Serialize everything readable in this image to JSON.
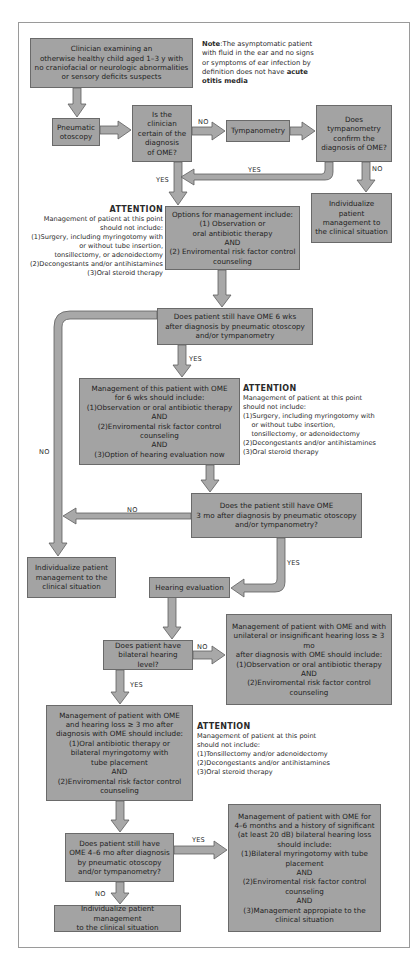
{
  "colors": {
    "box_fill": "#a3a3a3",
    "box_border": "#6a6a6a",
    "arrow_fill": "#a8a8a8",
    "arrow_stroke": "#5e5e5e",
    "frame_border": "#9a9a9a"
  },
  "note": {
    "label": "Note",
    "text": ":The asymptomatic patient with fluid in the ear and no signs or symptoms of ear infection by definition does not have ",
    "bold_end": "acute otitis media"
  },
  "nodes": {
    "start": "Clinician examining an\notherwise healthy child aged 1–3 y with\nno craniofacial or neurologic abnormalities\nor sensory deficits suspects",
    "pneumatic": "Pneumatic\notoscopy",
    "certain": "Is the\nclinician\ncertain of the\ndiagnosis\nof OME?",
    "tympanometry": "Tympanometry",
    "tymp_confirm": "Does\ntympanometry\nconfirm the\ndiagnosis of OME?",
    "individualize_1": "Individualize\npatient\nmanagement to\nthe clinical situation",
    "options": "Options for management include:\n(1) Observation or\noral antibiotic therapy\nAND\n(2) Enviromental risk factor control\ncounseling",
    "six_wks": "Does patient still have OME 6 wks\nafter diagnosis by pneumatic otoscopy\nand/or tympanometry",
    "mgmt_6wks": "Management of this patient with OME\nfor 6 wks should include:\n(1)Observation or oral antibiotic therapy\nAND\n(2)Enviromental risk factor control\ncounseling\nAND\n(3)Option of hearing evaluation now",
    "three_mo": "Does the patient still have OME\n3 mo after diagnosis by pneumatic otoscopy\nand/or tympanometry?",
    "individualize_2": "Individualize patient\nmanagement to the\nclinical situation",
    "hearing_eval": "Hearing evaluation",
    "bilateral": "Does patient have\nbilateral hearing level?",
    "unilateral_mgmt": "Management of patient with OME and with\nunilateral or insignificant hearing loss ≥ 3\nmo\nafter diagnosis with OME should include:\n(1)Observation or oral antibiotic therapy\nAND\n(2)Enviromental risk factor control\ncounseling",
    "hearing_loss_mgmt": "Management of patient with OME\nand hearing loss ≥ 3 mo after\ndiagnosis with OME should include:\n(1)Oral antibiotic therapy or\nbilateral myringotomy with\ntube placement\nAND\n(2)Enviromental risk factor control\ncounseling",
    "four_six_mo": "Does patient still have\nOME 4–6 mo after diagnosis\nby pneumatic otoscopy\nand/or tympanometry?",
    "individualize_3": "Individualize patient management\nto the clinical situation",
    "final_mgmt": "Management of patient with OME for\n4–6 months and a history of significant\n(at least 20 dB) bilateral hearing loss\nshould include:\n(1)Bilateral myringotomy with tube\nplacement\nAND\n(2)Enviromental risk factor control\ncounseling\nAND\n(3)Management appropiate to the\nclinical situation"
  },
  "attention_1": {
    "title": "ATTENTION",
    "lines": [
      "Management of patient at this point",
      "should not include:",
      "(1)Surgery, including myringotomy with",
      "or without tube insertion,",
      "tonsillectomy, or adenoidectomy",
      "(2)Decongestants and/or antihistamines",
      "(3)Oral steroid therapy"
    ]
  },
  "attention_2": {
    "title": "ATTENTION",
    "lines": [
      "Management of patient at this point",
      "should not include:",
      "(1)Surgery, including myringotomy with",
      "    or without tube insertion,",
      "    tonsillectomy, or adenoidectomy",
      "(2)Decongestants and/or antihistamines",
      "(3)Oral steroid therapy"
    ]
  },
  "attention_3": {
    "title": "ATTENTION",
    "lines": [
      "Management of patient at this point",
      "should not include:",
      "(1)Tonsillectomy and/or adenoidectomy",
      "(2)Decongestants and/or antihistamines",
      "(3)Oral steroid therapy"
    ]
  },
  "edge_labels": {
    "certain_no": "NO",
    "tymp_yes": "YES",
    "certain_yes": "YES",
    "tymp_no": "NO",
    "six_wks_yes": "YES",
    "six_wks_no": "NO",
    "three_mo_no": "NO",
    "three_mo_yes": "YES",
    "bilateral_no": "NO",
    "bilateral_yes": "YES",
    "four_six_yes": "YES",
    "four_six_no": "NO"
  }
}
